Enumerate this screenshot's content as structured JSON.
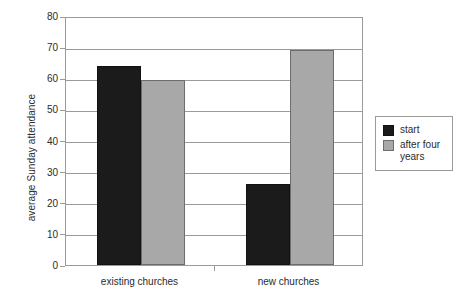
{
  "chart_data": {
    "type": "bar",
    "title": "",
    "subtitle": "",
    "xlabel": "",
    "ylabel": "average Sunday attendance",
    "categories": [
      "existing churches",
      "new churches"
    ],
    "series": [
      {
        "name": "start",
        "color": "#1b1b1b",
        "values": [
          64,
          26
        ]
      },
      {
        "name": "after four years",
        "color": "#a8a8a8",
        "values": [
          59.5,
          69
        ]
      }
    ],
    "ylim": [
      0,
      80
    ],
    "ytick_labels": [
      "0",
      "10",
      "20",
      "30",
      "40",
      "50",
      "60",
      "70",
      "80"
    ],
    "ytick_values": [
      0,
      10,
      20,
      30,
      40,
      50,
      60,
      70,
      80
    ],
    "grid": true,
    "legend_position": "right",
    "legend_entries": [
      "start",
      "after four years"
    ]
  },
  "legend": {
    "entries": [
      {
        "label": "start"
      },
      {
        "label": "after four years"
      }
    ]
  }
}
